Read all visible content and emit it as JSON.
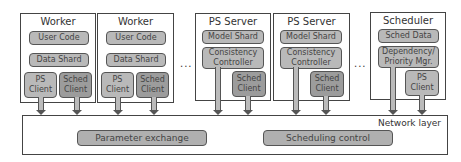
{
  "workers": [
    {
      "title": "Worker",
      "user_code": "User Code",
      "data_shard": "Data Shard",
      "ps_client": "PS\nClient",
      "sched_client": "Sched\nClient"
    },
    {
      "title": "Worker",
      "user_code": "User Code",
      "data_shard": "Data Shard",
      "ps_client": "PS\nClient",
      "sched_client": "Sched\nClient"
    }
  ],
  "ps_servers": [
    {
      "title": "PS Server",
      "model_shard": "Model Shard",
      "consistency_controller": "Consistency\nController",
      "sched_client": "Sched\nClient"
    },
    {
      "title": "PS Server",
      "model_shard": "Model Shard",
      "consistency_controller": "Consistency\nController",
      "sched_client": "Sched\nClient"
    }
  ],
  "scheduler": {
    "title": "Scheduler",
    "sched_data": "Sched Data",
    "dependency_mgr": "Dependency/\nPriority Mgr.",
    "ps_client": "PS\nClient"
  },
  "ellipsis": "...",
  "network": {
    "label": "Network layer",
    "parameter_exchange": "Parameter exchange",
    "scheduling_control": "Scheduling control"
  },
  "colors": {
    "component_fill": "#b9b9b9",
    "client_dark_fill": "#9c9c9c",
    "border": "#444444"
  }
}
